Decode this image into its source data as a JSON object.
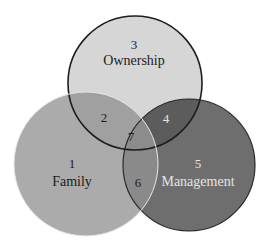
{
  "diagram": {
    "type": "venn",
    "sets": [
      {
        "id": "ownership",
        "number": "3",
        "name": "Ownership",
        "fill": "#d6d6d6",
        "stroke": "#1e1e1e"
      },
      {
        "id": "family",
        "number": "1",
        "name": "Family",
        "fill": "#ababab",
        "stroke": "#e6e6e6"
      },
      {
        "id": "management",
        "number": "5",
        "name": "Management",
        "fill": "#6e6e6e",
        "stroke": "#2a2a2a"
      }
    ],
    "regions": [
      {
        "number": "1",
        "sets": [
          "Family"
        ]
      },
      {
        "number": "2",
        "sets": [
          "Family",
          "Ownership"
        ]
      },
      {
        "number": "3",
        "sets": [
          "Ownership"
        ]
      },
      {
        "number": "4",
        "sets": [
          "Ownership",
          "Management"
        ]
      },
      {
        "number": "5",
        "sets": [
          "Management"
        ]
      },
      {
        "number": "6",
        "sets": [
          "Family",
          "Management"
        ]
      },
      {
        "number": "7",
        "sets": [
          "Family",
          "Ownership",
          "Management"
        ]
      }
    ]
  }
}
